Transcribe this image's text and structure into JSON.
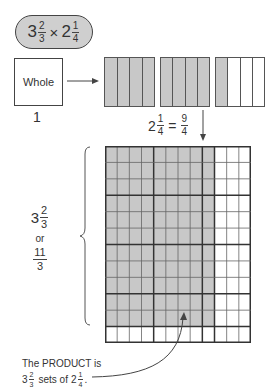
{
  "title_expression": {
    "first_whole": "3",
    "first_num": "2",
    "first_den": "3",
    "operator": "×",
    "second_whole": "2",
    "second_num": "1",
    "second_den": "4"
  },
  "whole_box": {
    "label": "Whole",
    "value_label": "1"
  },
  "fraction_bars": [
    {
      "parts": 4,
      "shaded": 4
    },
    {
      "parts": 4,
      "shaded": 4
    },
    {
      "parts": 4,
      "shaded": 1
    }
  ],
  "equation": {
    "whole": "2",
    "num": "1",
    "den": "4",
    "equals": "=",
    "improper_num": "9",
    "improper_den": "4"
  },
  "grid": {
    "columns": 12,
    "rows": 12,
    "shaded_columns": 9,
    "shaded_rows": 11,
    "heavy_col_every": 4,
    "heavy_row_every": 3,
    "shade_color": "#c8c8c8"
  },
  "left_label": {
    "whole": "3",
    "num": "2",
    "den": "3",
    "or": "or",
    "improper_num": "11",
    "improper_den": "3"
  },
  "product_caption": {
    "line1": "The PRODUCT is",
    "whole": "3",
    "num": "2",
    "den": "3",
    "middle": "sets of",
    "whole2": "2",
    "num2": "1",
    "den2": "4",
    "end": "."
  }
}
